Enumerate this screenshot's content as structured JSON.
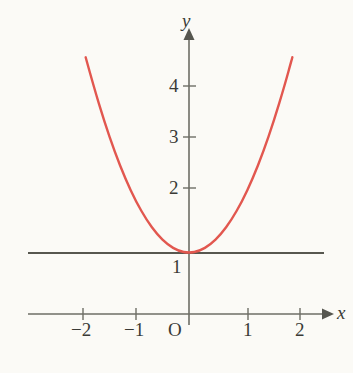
{
  "figure": {
    "background_color": "#fbfaf6",
    "axis_color": "#6e6e66",
    "gridline_color": "#57574f",
    "curve_color": "#e2574f",
    "text_color": "#3a3a36",
    "width": 353,
    "height": 373
  },
  "axes": {
    "x_axis_label": "x",
    "y_axis_label": "y",
    "origin_label": "O",
    "x_ticks": [
      {
        "label": "−2",
        "value": -2,
        "px": 83
      },
      {
        "label": "−1",
        "value": -1,
        "px": 136
      },
      {
        "label": "1",
        "value": 1,
        "px": 248
      },
      {
        "label": "2",
        "value": 2,
        "px": 300
      }
    ],
    "y_ticks": [
      {
        "label": "1",
        "value": 1,
        "px": 253
      },
      {
        "label": "2",
        "value": 2,
        "px": 188
      },
      {
        "label": "3",
        "value": 3,
        "px": 137
      },
      {
        "label": "4",
        "value": 4,
        "px": 86
      }
    ]
  },
  "chart_data": {
    "type": "line",
    "title": "",
    "subtitle": "",
    "xlabel": "x",
    "ylabel": "y",
    "xlim": [
      -2.6,
      2.6
    ],
    "ylim": [
      0.0,
      5.1
    ],
    "grid": false,
    "legend": null,
    "annotations": [
      {
        "text": "O",
        "role": "origin-label",
        "x": -0.2,
        "y": -0.3
      },
      {
        "text": "1",
        "role": "y-tick-label-on-horizontal-line",
        "x": -0.25,
        "y": 1
      }
    ],
    "extra_lines": [
      {
        "name": "horizontal-line-y-equals-1",
        "kind": "horizontal",
        "y": 1,
        "x_from": -2.95,
        "x_to": 2.6,
        "color": "#57574f"
      }
    ],
    "series": [
      {
        "name": "y = x² + 1",
        "kind": "parabola",
        "color": "#e2574f",
        "vertex": [
          0,
          1
        ],
        "x": [
          -1.95,
          -1.8,
          -1.6,
          -1.4,
          -1.2,
          -1.0,
          -0.8,
          -0.6,
          -0.4,
          -0.2,
          0.0,
          0.2,
          0.4,
          0.6,
          0.8,
          1.0,
          1.2,
          1.4,
          1.6,
          1.8,
          1.95
        ],
        "values": [
          4.8,
          4.24,
          3.56,
          2.96,
          2.44,
          2.0,
          1.64,
          1.36,
          1.16,
          1.04,
          1.0,
          1.04,
          1.16,
          1.36,
          1.64,
          2.0,
          2.44,
          2.96,
          3.56,
          4.24,
          4.8
        ]
      }
    ]
  }
}
